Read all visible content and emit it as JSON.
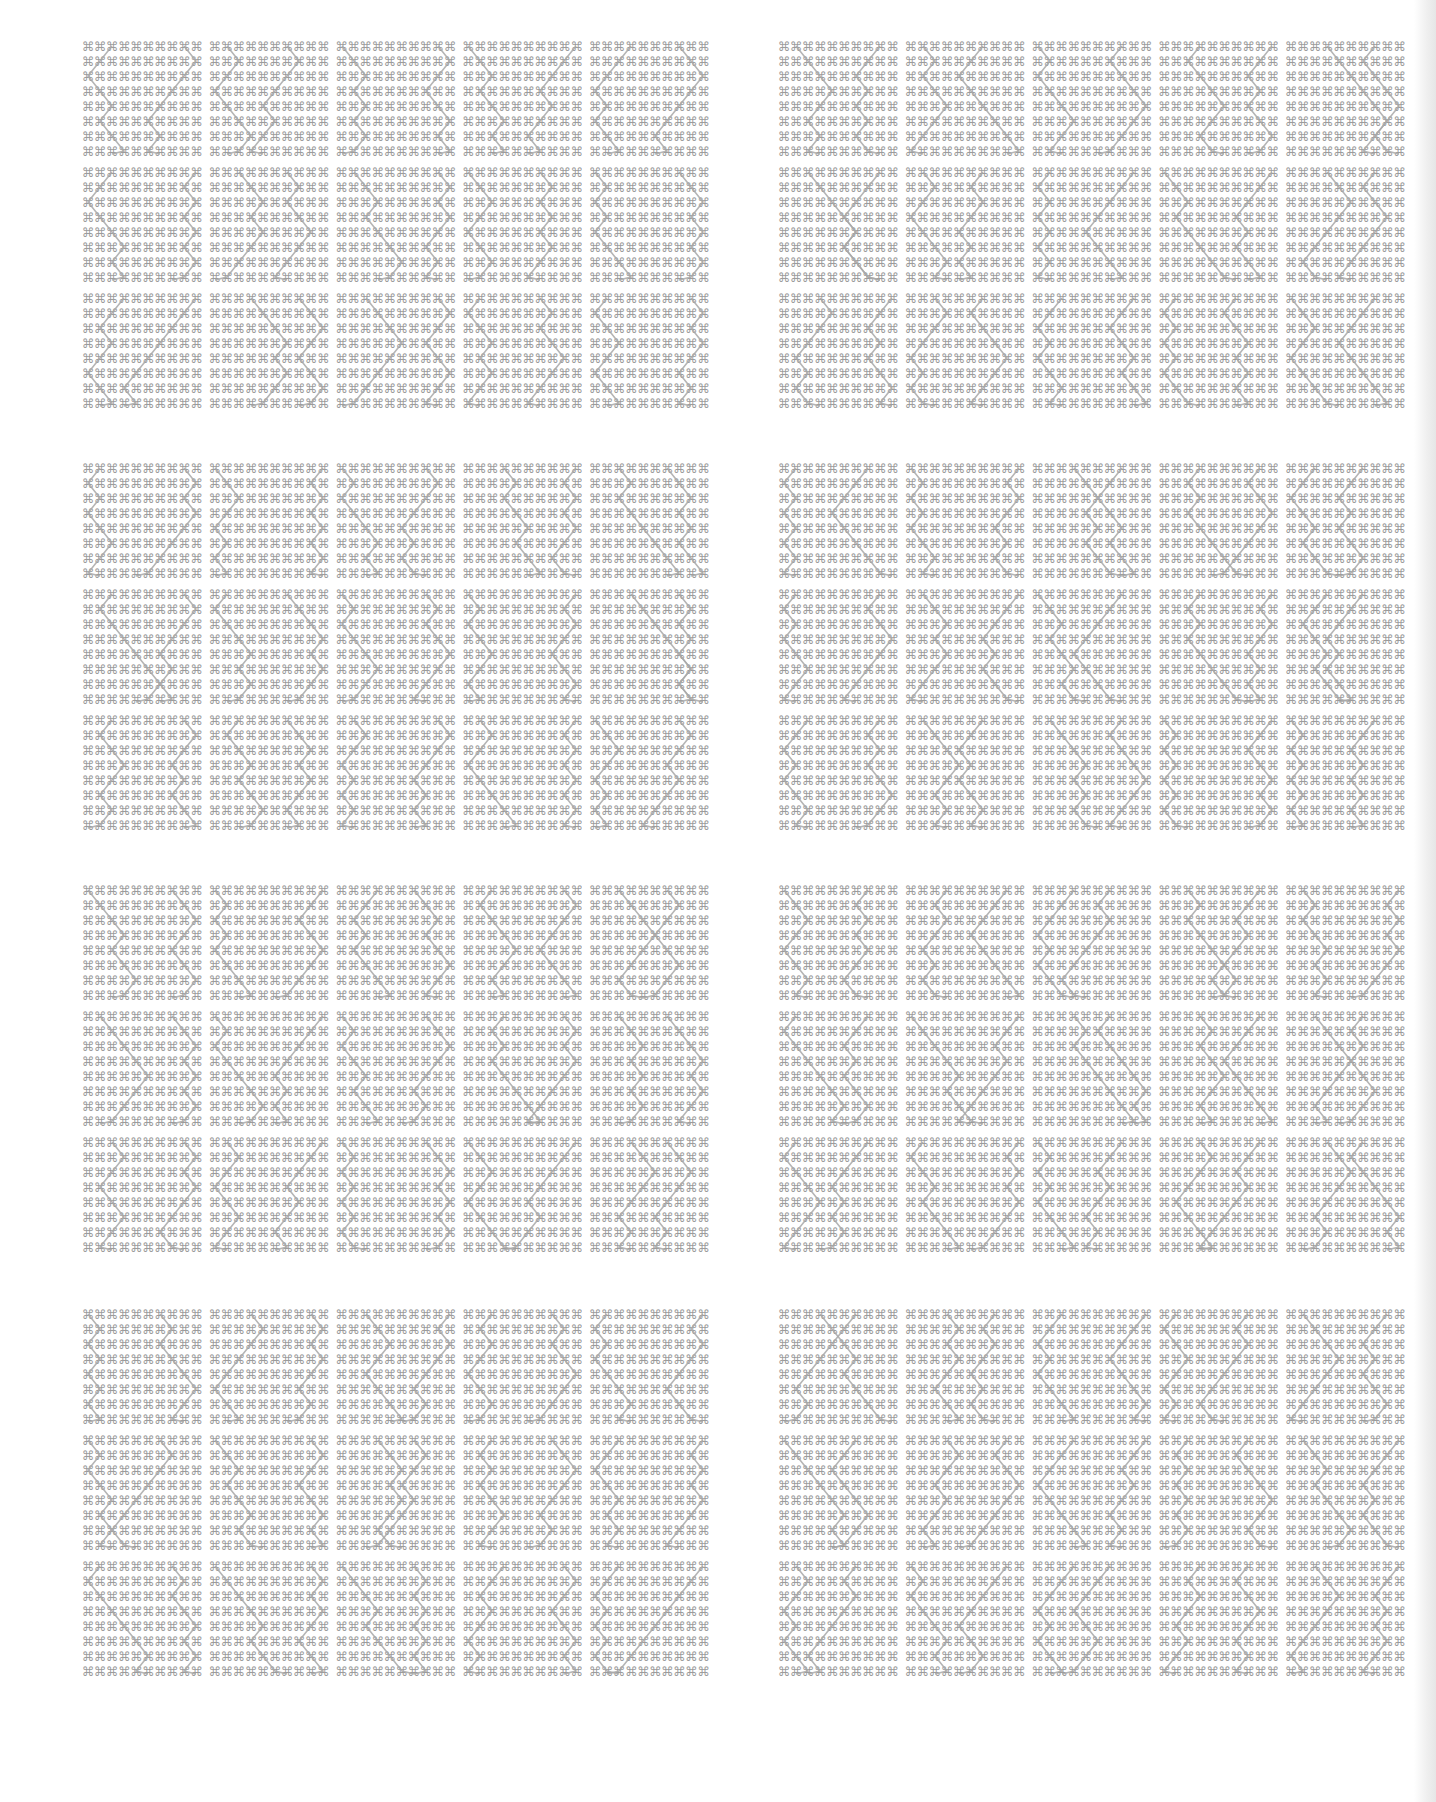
{
  "page": {
    "background": "#ffffff",
    "glyph_color": "#9c9c9c",
    "line_color": "#a8a8a8"
  },
  "pattern": {
    "glyph": "⌘",
    "glyph_name": "place-of-interest-sign",
    "rows_per_tile": 8,
    "cols_per_tile": 10
  },
  "layout": {
    "columns": [
      {
        "x": 82
      },
      {
        "x": 778
      }
    ],
    "rows": [
      {
        "y": 40
      },
      {
        "y": 462
      },
      {
        "y": 884
      },
      {
        "y": 1308
      }
    ],
    "tiles_per_block": {
      "cols": 5,
      "rows": 3
    }
  },
  "blocks": [
    {
      "id": "block-1-left",
      "col": 0,
      "row": 0
    },
    {
      "id": "block-1-right",
      "col": 1,
      "row": 0
    },
    {
      "id": "block-2-left",
      "col": 0,
      "row": 1
    },
    {
      "id": "block-2-right",
      "col": 1,
      "row": 1
    },
    {
      "id": "block-3-left",
      "col": 0,
      "row": 2
    },
    {
      "id": "block-3-right",
      "col": 1,
      "row": 2
    },
    {
      "id": "block-4-left",
      "col": 0,
      "row": 3
    },
    {
      "id": "block-4-right",
      "col": 1,
      "row": 3
    }
  ]
}
